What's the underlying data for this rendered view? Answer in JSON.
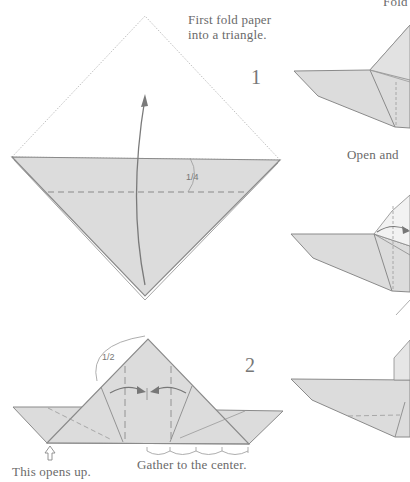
{
  "diagram": {
    "colors": {
      "paper": "#dcdcdc",
      "edge": "#8a8a8a",
      "text": "#6a6a6a",
      "background": "#ffffff"
    },
    "top_right_caption": "Fold",
    "step1": {
      "number": "1",
      "caption_line1": "First fold paper",
      "caption_line2": "into a triangle.",
      "fraction_label": "1/4"
    },
    "step2": {
      "number": "2",
      "fraction_label": "1/2",
      "caption_opens": "This opens up.",
      "caption_gather": "Gather to the center."
    },
    "right_column": {
      "caption_open": "Open and"
    }
  }
}
